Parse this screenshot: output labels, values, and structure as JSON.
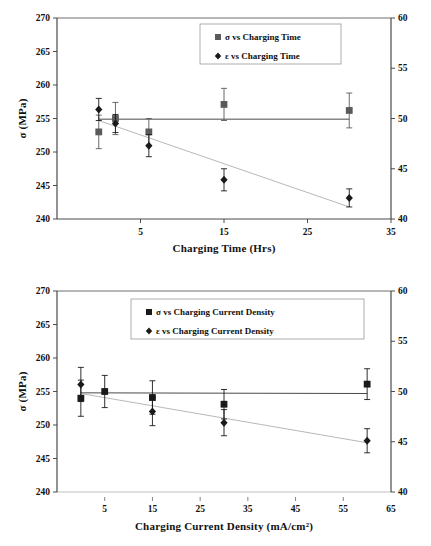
{
  "figures": [
    {
      "id": "charging-time",
      "chart_data": {
        "type": "scatter",
        "title": "",
        "xlabel": "Charging Time (Hrs)",
        "ylabel": "σ (MPa)",
        "y2label": "",
        "xlim": [
          -5,
          35
        ],
        "ylim": [
          240,
          270
        ],
        "y2lim": [
          40,
          60
        ],
        "xticks": [
          5,
          15,
          25,
          35
        ],
        "xticklabels": [
          "5",
          "15",
          "25",
          "35"
        ],
        "yticks": [
          240,
          245,
          250,
          255,
          260,
          265,
          270
        ],
        "yticklabels": [
          "240",
          "245",
          "250",
          "255",
          "260",
          "265",
          "270"
        ],
        "y2ticks": [
          40,
          45,
          50,
          55,
          60
        ],
        "y2ticklabels": [
          "40",
          "45",
          "50",
          "55",
          "60"
        ],
        "grid": false,
        "legend_position": "top-center",
        "series": [
          {
            "name": "σ vs Charging Time",
            "axis": "left",
            "marker": "square",
            "color": "#5a5a5a",
            "x": [
              0,
              2,
              6,
              15,
              30
            ],
            "values": [
              253.0,
              255.0,
              253.0,
              257.1,
              256.2
            ],
            "yerr": [
              2.5,
              2.4,
              2.0,
              2.4,
              2.6
            ],
            "trend": {
              "x": [
                0,
                30
              ],
              "values": [
                254.9,
                254.9
              ]
            }
          },
          {
            "name": "ε vs Charging Time",
            "axis": "right",
            "marker": "diamond",
            "color": "#1a1a1a",
            "x": [
              0,
              2,
              6,
              15,
              30
            ],
            "values": [
              50.9,
              49.5,
              47.3,
              43.9,
              42.1
            ],
            "yerr": [
              1.1,
              0.9,
              1.1,
              1.1,
              0.9
            ],
            "trend": {
              "x": [
                0,
                30
              ],
              "values": [
                49.8,
                41.2
              ]
            }
          }
        ]
      },
      "legend": [
        {
          "marker": "square",
          "label": "σ vs Charging Time",
          "color": "#5a5a5a"
        },
        {
          "marker": "diamond",
          "label": "ε vs Charging Time",
          "color": "#1a1a1a"
        }
      ]
    },
    {
      "id": "current-density",
      "chart_data": {
        "type": "scatter",
        "title": "",
        "xlabel": "Charging Current Density (mA/cm²)",
        "ylabel": "σ (MPa)",
        "y2label": "",
        "xlim": [
          -5,
          65
        ],
        "ylim": [
          240,
          270
        ],
        "y2lim": [
          40,
          60
        ],
        "xticks": [
          5,
          15,
          25,
          35,
          45,
          55,
          65
        ],
        "xticklabels": [
          "5",
          "15",
          "25",
          "35",
          "45",
          "55",
          "65"
        ],
        "yticks": [
          240,
          245,
          250,
          255,
          260,
          265,
          270
        ],
        "yticklabels": [
          "240",
          "245",
          "250",
          "255",
          "260",
          "265",
          "270"
        ],
        "y2ticks": [
          40,
          45,
          50,
          55,
          60
        ],
        "y2ticklabels": [
          "40",
          "45",
          "50",
          "55",
          "60"
        ],
        "grid": false,
        "legend_position": "top-center",
        "series": [
          {
            "name": "σ vs Charging Current Density",
            "axis": "left",
            "marker": "square",
            "color": "#1a1a1a",
            "x": [
              0,
              5,
              15,
              30,
              60
            ],
            "values": [
              254.0,
              255.0,
              254.1,
              253.1,
              256.1
            ],
            "yerr": [
              2.7,
              2.4,
              2.5,
              2.2,
              2.3
            ],
            "trend": {
              "x": [
                0,
                60
              ],
              "values": [
                254.8,
                254.7
              ]
            }
          },
          {
            "name": "ε vs Charging Current Density",
            "axis": "right",
            "marker": "diamond",
            "color": "#1a1a1a",
            "x": [
              0,
              15,
              30,
              60
            ],
            "values": [
              50.7,
              48.0,
              46.9,
              45.1
            ],
            "yerr": [
              1.7,
              1.4,
              1.3,
              1.2
            ],
            "trend": {
              "x": [
                0,
                60
              ],
              "values": [
                49.8,
                44.9
              ]
            }
          }
        ]
      },
      "legend": [
        {
          "marker": "square",
          "label": "σ vs Charging Current Density",
          "color": "#1a1a1a"
        },
        {
          "marker": "diamond",
          "label": "ε vs Charging Current Density",
          "color": "#1a1a1a"
        }
      ]
    }
  ]
}
